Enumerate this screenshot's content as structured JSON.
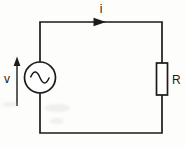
{
  "diagram": {
    "type": "electrical-circuit-schematic",
    "labels": {
      "current": "i",
      "voltage": "v",
      "resistor": "R"
    },
    "components": {
      "source": "ac-voltage-source",
      "load": "resistor",
      "current_direction": "clockwise (rightward along top wire)",
      "voltage_polarity": "upward arrow beside source"
    },
    "colors": {
      "line": "#1b1b1b",
      "background": "#fdfdfc",
      "component_fill": "#ffffff"
    }
  }
}
